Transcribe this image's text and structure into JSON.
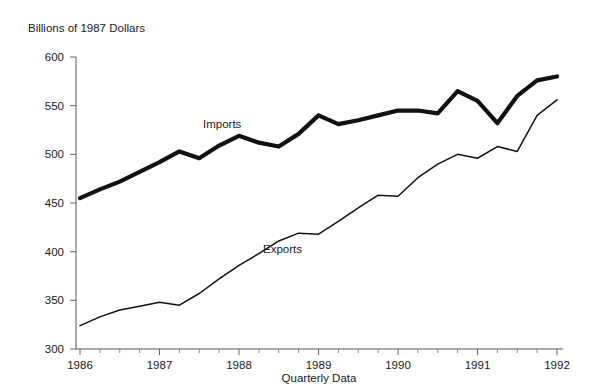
{
  "chart_data": {
    "type": "line",
    "title": "Billions of 1987 Dollars",
    "xlabel": "Quarterly Data",
    "ylabel": "Billions of 1987 Dollars",
    "ylim": [
      300,
      600
    ],
    "ytick_labels": [
      "300",
      "350",
      "400",
      "450",
      "500",
      "550",
      "600"
    ],
    "yticks": [
      300,
      350,
      400,
      450,
      500,
      550,
      600
    ],
    "xtick_labels": [
      "1986",
      "1987",
      "1988",
      "1989",
      "1990",
      "1991",
      "1992"
    ],
    "xticks": [
      1986,
      1987,
      1988,
      1989,
      1990,
      1991,
      1992
    ],
    "grid": false,
    "legend_position": "inline-annotation",
    "x": [
      "1986Q1",
      "1986Q2",
      "1986Q3",
      "1986Q4",
      "1987Q1",
      "1987Q2",
      "1987Q3",
      "1987Q4",
      "1988Q1",
      "1988Q2",
      "1988Q3",
      "1988Q4",
      "1989Q1",
      "1989Q2",
      "1989Q3",
      "1989Q4",
      "1990Q1",
      "1990Q2",
      "1990Q3",
      "1990Q4",
      "1991Q1",
      "1991Q2",
      "1991Q3",
      "1991Q4",
      "1992Q1"
    ],
    "series": [
      {
        "name": "Imports",
        "annotation": "Imports",
        "style": "thick",
        "values": [
          455,
          464,
          472,
          482,
          492,
          503,
          496,
          509,
          519,
          512,
          508,
          521,
          540,
          531,
          535,
          540,
          545,
          545,
          542,
          565,
          555,
          532,
          560,
          576,
          580
        ]
      },
      {
        "name": "Exports",
        "annotation": "Exports",
        "style": "thin",
        "values": [
          324,
          333,
          340,
          344,
          348,
          345,
          357,
          372,
          386,
          398,
          411,
          419,
          418,
          431,
          445,
          458,
          457,
          476,
          490,
          500,
          496,
          508,
          503,
          540,
          556
        ]
      }
    ]
  },
  "annotations": {
    "imports_label": "Imports",
    "exports_label": "Exports"
  }
}
